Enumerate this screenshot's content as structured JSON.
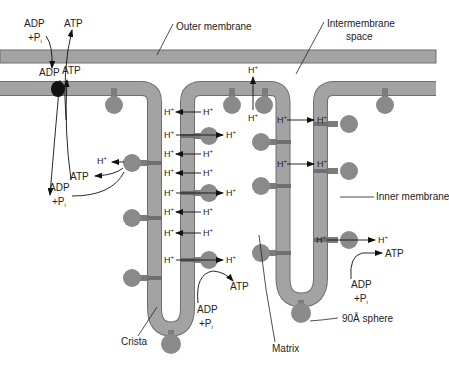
{
  "colors": {
    "membrane_fill": "#a3a3a3",
    "membrane_edge": "#6f6f6f",
    "sphere_fill": "#8a8a8a",
    "stalk_fill": "#7c7c7c",
    "translocase": "#111111",
    "line": "#222222",
    "background": "#ffffff"
  },
  "labels": {
    "outer_membrane": "Outer membrane",
    "intermembrane_space_line1": "Intermembrane",
    "intermembrane_space_line2": "space",
    "inner_membrane": "Inner membrane",
    "crista": "Crista",
    "matrix": "Matrix",
    "sphere": "90Å sphere"
  },
  "chem": {
    "adp": "ADP",
    "pi": "+P",
    "pi_sub": "i",
    "atp": "ATP",
    "h": "H",
    "h_sup": "+"
  },
  "proton_arrows": {
    "left_crista": [
      {
        "y": 112,
        "direction": "in"
      },
      {
        "y": 135,
        "direction": "out"
      },
      {
        "y": 155,
        "direction": "in"
      },
      {
        "y": 173,
        "direction": "in"
      },
      {
        "y": 193,
        "direction": "out"
      },
      {
        "y": 212,
        "direction": "in"
      },
      {
        "y": 233,
        "direction": "in"
      },
      {
        "y": 260,
        "direction": "out"
      }
    ],
    "right_crista": [
      {
        "y": 120,
        "direction": "out"
      },
      {
        "y": 164,
        "direction": "out"
      },
      {
        "y": 240,
        "direction": "out"
      }
    ]
  }
}
